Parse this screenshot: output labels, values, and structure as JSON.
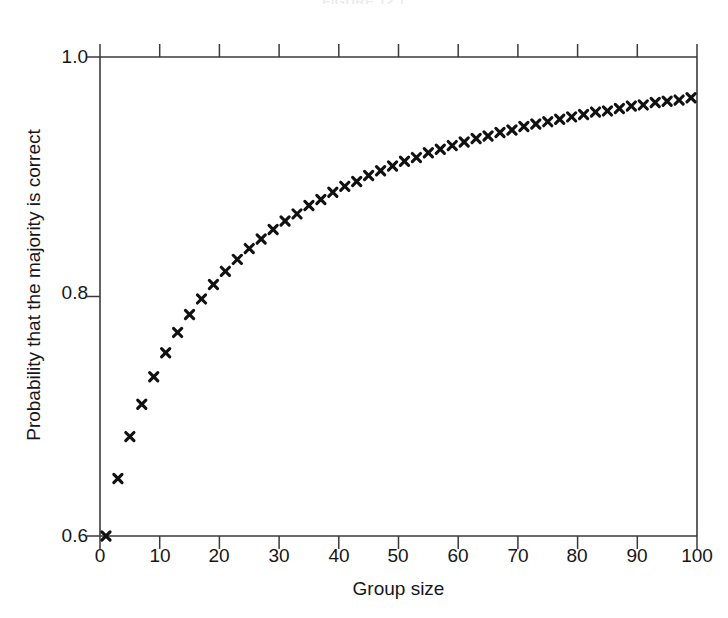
{
  "figure": {
    "title_faint": "FIGURE 12.1",
    "background": "#ffffff",
    "ink_color": "#16161a",
    "marker_color": "#111111"
  },
  "axes": {
    "x_label": "Group size",
    "y_label": "Probability that the majority is correct",
    "x_ticks": [
      "0",
      "10",
      "20",
      "30",
      "40",
      "50",
      "60",
      "70",
      "80",
      "90",
      "100"
    ],
    "y_ticks": [
      "0.6",
      "0.8",
      "1.0"
    ]
  },
  "chart_data": {
    "type": "scatter",
    "title": "",
    "xlabel": "Group size",
    "ylabel": "Probability that the majority is correct",
    "xlim": [
      0,
      100
    ],
    "ylim": [
      0.6,
      1.0
    ],
    "xticks": [
      0,
      10,
      20,
      30,
      40,
      50,
      60,
      70,
      80,
      90,
      100
    ],
    "yticks": [
      0.6,
      0.8,
      1.0
    ],
    "grid": false,
    "legend": null,
    "marker": "x",
    "marker_color": "#111111",
    "series": [
      {
        "name": "Majority correct (individual competence p = 0.6)",
        "x": [
          1,
          3,
          5,
          7,
          9,
          11,
          13,
          15,
          17,
          19,
          21,
          23,
          25,
          27,
          29,
          31,
          33,
          35,
          37,
          39,
          41,
          43,
          45,
          47,
          49,
          51,
          53,
          55,
          57,
          59,
          61,
          63,
          65,
          67,
          69,
          71,
          73,
          75,
          77,
          79,
          81,
          83,
          85,
          87,
          89,
          91,
          93,
          95,
          97,
          99
        ],
        "y": [
          0.6,
          0.648,
          0.683,
          0.71,
          0.733,
          0.753,
          0.77,
          0.785,
          0.798,
          0.81,
          0.821,
          0.831,
          0.84,
          0.848,
          0.856,
          0.863,
          0.869,
          0.876,
          0.881,
          0.887,
          0.892,
          0.896,
          0.901,
          0.905,
          0.909,
          0.913,
          0.916,
          0.92,
          0.923,
          0.926,
          0.929,
          0.932,
          0.934,
          0.937,
          0.939,
          0.942,
          0.944,
          0.946,
          0.948,
          0.95,
          0.952,
          0.954,
          0.955,
          0.957,
          0.959,
          0.96,
          0.962,
          0.963,
          0.964,
          0.966
        ]
      }
    ]
  }
}
